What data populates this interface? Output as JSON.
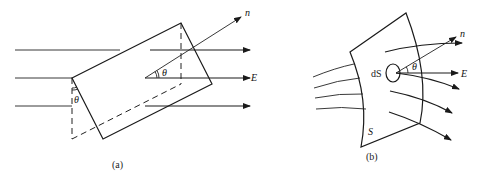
{
  "figure_a": {
    "caption": "(a)",
    "labels": {
      "normal": "n",
      "field": "E",
      "angle_center": "θ",
      "angle_left": "θ"
    }
  },
  "figure_b": {
    "caption": "(b)",
    "labels": {
      "normal": "n",
      "field": "E",
      "angle": "θ",
      "element": "dS",
      "surface": "S"
    }
  },
  "colors": {
    "ink": "#1a1a1a",
    "background": "#ffffff"
  }
}
